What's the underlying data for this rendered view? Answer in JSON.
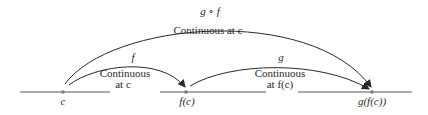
{
  "diagram": {
    "points": [
      {
        "id": "c",
        "label": "c"
      },
      {
        "id": "fc",
        "label": "f(c)"
      },
      {
        "id": "gfc",
        "label": "g(f(c))"
      }
    ],
    "arrows": [
      {
        "id": "f",
        "name": "f",
        "caption_line1": "Continuous",
        "caption_line2": "at c"
      },
      {
        "id": "g",
        "name": "g",
        "caption_line1": "Continuous",
        "caption_line2": "at f(c)"
      },
      {
        "id": "gf",
        "name": "g ∘ f",
        "caption": "Continuous at c"
      }
    ],
    "colors": {
      "line": "#3a3a3a",
      "text": "#2a2a2a",
      "point": "#7a7a7a"
    }
  }
}
